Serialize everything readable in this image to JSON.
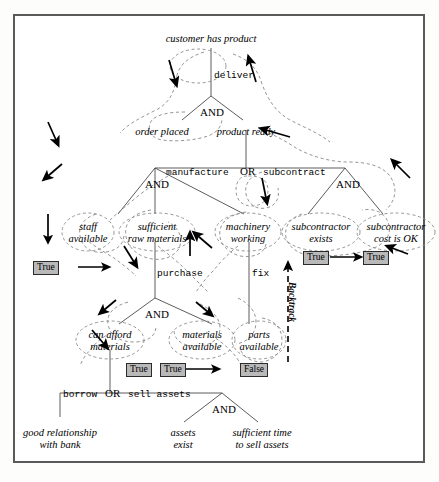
{
  "diagram": {
    "type": "and-or-goal-tree",
    "title_visible": false,
    "frame": {
      "border_color": "#5a5a5a",
      "background": "#ffffff"
    },
    "styles": {
      "goal_text": "italic serif",
      "action_text": "monospace",
      "traversal_path": "dashed",
      "value_box_fill": "#b9b9b9",
      "value_box_border": "#2b2b2b"
    },
    "goals": [
      {
        "id": "g0",
        "label": "customer has product",
        "kind": "goal"
      },
      {
        "id": "g1",
        "label": "order placed",
        "kind": "goal"
      },
      {
        "id": "g2",
        "label": "product ready",
        "kind": "goal"
      },
      {
        "id": "g3",
        "label": "staff\navailable",
        "line1": "staff",
        "line2": "available",
        "kind": "goal"
      },
      {
        "id": "g4",
        "label": "sufficient\nraw materials",
        "line1": "sufficient",
        "line2": "raw materials",
        "kind": "goal"
      },
      {
        "id": "g5",
        "label": "machinery\nworking",
        "line1": "machinery",
        "line2": "working",
        "kind": "goal"
      },
      {
        "id": "g6",
        "label": "subcontractor\nexists",
        "line1": "subcontractor",
        "line2": "exists",
        "kind": "goal"
      },
      {
        "id": "g7",
        "label": "subcontractor\ncost is OK",
        "line1": "subcontractor",
        "line2": "cost is OK",
        "kind": "goal"
      },
      {
        "id": "g8",
        "label": "can afford\nmaterials",
        "line1": "can afford",
        "line2": "materials",
        "kind": "goal"
      },
      {
        "id": "g9",
        "label": "materials\navailable",
        "line1": "materials",
        "line2": "available",
        "kind": "goal"
      },
      {
        "id": "g10",
        "label": "parts\navailable",
        "line1": "parts",
        "line2": "available",
        "kind": "goal"
      },
      {
        "id": "g11",
        "label": "good relationship\nwith bank",
        "line1": "good relationship",
        "line2": "with bank",
        "kind": "goal"
      },
      {
        "id": "g12",
        "label": "assets\nexist",
        "line1": "assets",
        "line2": "exist",
        "kind": "goal"
      },
      {
        "id": "g13",
        "label": "sufficient time\nto sell assets",
        "line1": "sufficient time",
        "line2": "to sell assets",
        "kind": "goal"
      }
    ],
    "actions": [
      {
        "id": "a0",
        "label": "deliver"
      },
      {
        "id": "a1",
        "label": "manufacture"
      },
      {
        "id": "a2",
        "label": "subcontract"
      },
      {
        "id": "a3",
        "label": "purchase"
      },
      {
        "id": "a4",
        "label": "fix"
      },
      {
        "id": "a5",
        "label": "borrow"
      },
      {
        "id": "a6",
        "label": "sell assets"
      }
    ],
    "gates": [
      {
        "id": "and0",
        "label": "AND"
      },
      {
        "id": "and1",
        "label": "AND"
      },
      {
        "id": "and2",
        "label": "AND"
      },
      {
        "id": "and3",
        "label": "AND"
      },
      {
        "id": "and4",
        "label": "AND"
      },
      {
        "id": "or0",
        "label": "OR"
      },
      {
        "id": "or1",
        "label": "OR"
      }
    ],
    "values": [
      {
        "id": "v0",
        "label": "True",
        "attached_to": "staff available"
      },
      {
        "id": "v1",
        "label": "True",
        "attached_to": "subcontractor exists"
      },
      {
        "id": "v2",
        "label": "True",
        "attached_to": "subcontractor cost is OK"
      },
      {
        "id": "v3",
        "label": "True",
        "attached_to": "can afford materials"
      },
      {
        "id": "v4",
        "label": "True",
        "attached_to": "materials available"
      },
      {
        "id": "v5",
        "label": "False",
        "attached_to": "parts available"
      }
    ],
    "annotations": [
      {
        "id": "n0",
        "label": "Backtrack",
        "orientation": "vertical"
      }
    ]
  }
}
